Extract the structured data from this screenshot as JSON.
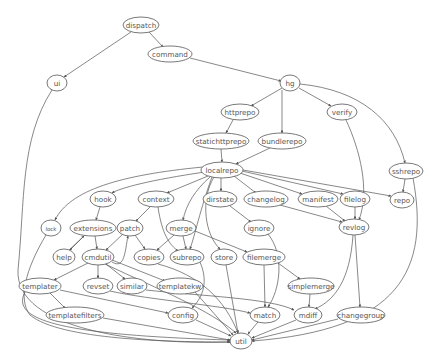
{
  "diagram": {
    "type": "directed-graph",
    "nodes": [
      {
        "id": "dispatch",
        "label": "dispatch",
        "x": 141,
        "y": 25,
        "rx": 18,
        "ry": 8
      },
      {
        "id": "command",
        "label": "command",
        "x": 170,
        "y": 54,
        "rx": 22,
        "ry": 8
      },
      {
        "id": "ui",
        "label": "ui",
        "x": 57,
        "y": 83,
        "rx": 10,
        "ry": 8
      },
      {
        "id": "hg",
        "label": "hg",
        "x": 290,
        "y": 83,
        "rx": 10,
        "ry": 8
      },
      {
        "id": "httprepo",
        "label": "httprepo",
        "x": 240,
        "y": 112,
        "rx": 19,
        "ry": 8
      },
      {
        "id": "verify",
        "label": "verify",
        "x": 342,
        "y": 112,
        "rx": 15,
        "ry": 8
      },
      {
        "id": "statichttprepo",
        "label": "statichttprepo",
        "x": 221,
        "y": 141,
        "rx": 28,
        "ry": 8
      },
      {
        "id": "bundlerepo",
        "label": "bundlerepo",
        "x": 282,
        "y": 141,
        "rx": 24,
        "ry": 8
      },
      {
        "id": "localrepo",
        "label": "localrepo",
        "x": 222,
        "y": 170,
        "rx": 21,
        "ry": 8
      },
      {
        "id": "sshrepo",
        "label": "sshrepo",
        "x": 406,
        "y": 171,
        "rx": 17,
        "ry": 8
      },
      {
        "id": "hook",
        "label": "hook",
        "x": 103,
        "y": 199,
        "rx": 13,
        "ry": 8
      },
      {
        "id": "context",
        "label": "context",
        "x": 156,
        "y": 199,
        "rx": 18,
        "ry": 8
      },
      {
        "id": "dirstate",
        "label": "dirstate",
        "x": 220,
        "y": 199,
        "rx": 17,
        "ry": 8
      },
      {
        "id": "changelog",
        "label": "changelog",
        "x": 266,
        "y": 199,
        "rx": 22,
        "ry": 8
      },
      {
        "id": "manifest",
        "label": "manifest",
        "x": 318,
        "y": 199,
        "rx": 20,
        "ry": 8
      },
      {
        "id": "filelog",
        "label": "filelog",
        "x": 355,
        "y": 199,
        "rx": 15,
        "ry": 8
      },
      {
        "id": "repo",
        "label": "repo",
        "x": 402,
        "y": 200,
        "rx": 12,
        "ry": 8
      },
      {
        "id": "lock",
        "label": "lock",
        "x": 51,
        "y": 228,
        "rx": 10,
        "ry": 8,
        "small": true
      },
      {
        "id": "extensions",
        "label": "extensions",
        "x": 93,
        "y": 228,
        "rx": 23,
        "ry": 8
      },
      {
        "id": "patch",
        "label": "patch",
        "x": 130,
        "y": 228,
        "rx": 13,
        "ry": 8
      },
      {
        "id": "merge",
        "label": "merge",
        "x": 181,
        "y": 228,
        "rx": 15,
        "ry": 8
      },
      {
        "id": "ignore",
        "label": "ignore",
        "x": 259,
        "y": 228,
        "rx": 15,
        "ry": 8
      },
      {
        "id": "revlog",
        "label": "revlog",
        "x": 354,
        "y": 227,
        "rx": 15,
        "ry": 8
      },
      {
        "id": "help",
        "label": "help",
        "x": 64,
        "y": 257,
        "rx": 11,
        "ry": 8
      },
      {
        "id": "cmdutil",
        "label": "cmdutil",
        "x": 98,
        "y": 257,
        "rx": 16,
        "ry": 8
      },
      {
        "id": "copies",
        "label": "copies",
        "x": 149,
        "y": 257,
        "rx": 15,
        "ry": 8
      },
      {
        "id": "subrepo",
        "label": "subrepo",
        "x": 187,
        "y": 257,
        "rx": 17,
        "ry": 8
      },
      {
        "id": "store",
        "label": "store",
        "x": 224,
        "y": 257,
        "rx": 13,
        "ry": 8
      },
      {
        "id": "filemerge",
        "label": "filemerge",
        "x": 264,
        "y": 257,
        "rx": 21,
        "ry": 8
      },
      {
        "id": "templater",
        "label": "templater",
        "x": 40,
        "y": 286,
        "rx": 21,
        "ry": 8
      },
      {
        "id": "revset",
        "label": "revset",
        "x": 98,
        "y": 286,
        "rx": 15,
        "ry": 8
      },
      {
        "id": "similar",
        "label": "similar",
        "x": 132,
        "y": 286,
        "rx": 15,
        "ry": 8
      },
      {
        "id": "templatekw",
        "label": "templatekw",
        "x": 180,
        "y": 286,
        "rx": 23,
        "ry": 8
      },
      {
        "id": "simplemerge",
        "label": "simplemerge",
        "x": 311,
        "y": 286,
        "rx": 23,
        "ry": 8
      },
      {
        "id": "templatefilters",
        "label": "templatefilters",
        "x": 75,
        "y": 315,
        "rx": 29,
        "ry": 8
      },
      {
        "id": "config",
        "label": "config",
        "x": 183,
        "y": 315,
        "rx": 15,
        "ry": 8
      },
      {
        "id": "match",
        "label": "match",
        "x": 265,
        "y": 315,
        "rx": 15,
        "ry": 8
      },
      {
        "id": "mdiff",
        "label": "mdiff",
        "x": 308,
        "y": 315,
        "rx": 14,
        "ry": 8
      },
      {
        "id": "changegroup",
        "label": "changegroup",
        "x": 361,
        "y": 315,
        "rx": 24,
        "ry": 8
      },
      {
        "id": "util",
        "label": "util",
        "x": 241,
        "y": 341,
        "rx": 11,
        "ry": 8
      }
    ],
    "edges": [
      {
        "from": "dispatch",
        "to": "command",
        "d": "M149,32 L163,47"
      },
      {
        "from": "dispatch",
        "to": "ui",
        "d": "M131,32 L64,77"
      },
      {
        "from": "command",
        "to": "hg",
        "d": "M190,58 L281,81"
      },
      {
        "from": "hg",
        "to": "httprepo",
        "d": "M282,88 L251,106"
      },
      {
        "from": "hg",
        "to": "bundlerepo",
        "d": "M282,90 L282,133"
      },
      {
        "from": "hg",
        "to": "verify",
        "d": "M299,88 L331,106"
      },
      {
        "from": "hg",
        "to": "sshrepo",
        "d": "M300,84 C360,90 395,120 405,163"
      },
      {
        "from": "httprepo",
        "to": "statichttprepo",
        "d": "M233,120 L226,133"
      },
      {
        "from": "statichttprepo",
        "to": "localrepo",
        "d": "M221,149 L222,162"
      },
      {
        "from": "bundlerepo",
        "to": "localrepo",
        "d": "M270,148 L236,164"
      },
      {
        "from": "verify",
        "to": "revlog",
        "d": "M346,120 C360,150 370,190 359,220"
      },
      {
        "from": "sshrepo",
        "to": "repo",
        "d": "M405,179 L403,192"
      },
      {
        "from": "sshrepo",
        "to": "util",
        "d": "M413,178 C430,270 400,330 252,341"
      },
      {
        "from": "ui",
        "to": "util",
        "d": "M52,90 C20,140 25,200 18,270 C15,330 140,345 230,342"
      },
      {
        "from": "localrepo",
        "to": "lock",
        "d": "M203,167 C120,175 70,190 55,220"
      },
      {
        "from": "localrepo",
        "to": "hook",
        "d": "M205,172 C150,180 120,188 112,193"
      },
      {
        "from": "localrepo",
        "to": "context",
        "d": "M208,176 L167,193"
      },
      {
        "from": "localrepo",
        "to": "merge",
        "d": "M210,177 C195,190 186,205 183,220"
      },
      {
        "from": "localrepo",
        "to": "store",
        "d": "M214,177 C200,200 205,235 220,249"
      },
      {
        "from": "localrepo",
        "to": "dirstate",
        "d": "M221,178 L221,191"
      },
      {
        "from": "localrepo",
        "to": "changelog",
        "d": "M234,176 L256,193"
      },
      {
        "from": "localrepo",
        "to": "manifest",
        "d": "M240,173 L302,194"
      },
      {
        "from": "localrepo",
        "to": "filelog",
        "d": "M242,171 L343,194"
      },
      {
        "from": "localrepo",
        "to": "repo",
        "d": "M243,170 L391,196"
      },
      {
        "from": "localrepo",
        "to": "subrepo",
        "d": "M212,177 C200,210 195,235 190,249"
      },
      {
        "from": "dirstate",
        "to": "ignore",
        "d": "M230,206 L251,222"
      },
      {
        "from": "changelog",
        "to": "revlog",
        "d": "M280,205 L342,222"
      },
      {
        "from": "manifest",
        "to": "revlog",
        "d": "M326,206 L345,221"
      },
      {
        "from": "filelog",
        "to": "revlog",
        "d": "M355,207 L355,219"
      },
      {
        "from": "revlog",
        "to": "changegroup",
        "d": "M355,235 L360,307"
      },
      {
        "from": "revlog",
        "to": "mdiff",
        "d": "M353,235 C350,280 335,300 315,309"
      },
      {
        "from": "ignore",
        "to": "match",
        "d": "M268,234 C285,255 280,290 268,307"
      },
      {
        "from": "hook",
        "to": "extensions",
        "d": "M100,207 L96,220"
      },
      {
        "from": "extensions",
        "to": "help",
        "d": "M85,235 L70,250"
      },
      {
        "from": "help",
        "to": "extensions",
        "d": "M69,250 L84,236"
      },
      {
        "from": "extensions",
        "to": "cmdutil",
        "d": "M95,236 L97,249"
      },
      {
        "from": "context",
        "to": "patch",
        "d": "M150,207 L136,221"
      },
      {
        "from": "context",
        "to": "subrepo",
        "d": "M158,207 C162,235 170,245 178,251"
      },
      {
        "from": "patch",
        "to": "cmdutil",
        "d": "M123,234 L106,250"
      },
      {
        "from": "patch",
        "to": "copies",
        "d": "M135,235 L145,249"
      },
      {
        "from": "merge",
        "to": "copies",
        "d": "M174,235 L157,250"
      },
      {
        "from": "merge",
        "to": "subrepo",
        "d": "M183,236 L186,249"
      },
      {
        "from": "merge",
        "to": "filemerge",
        "d": "M195,231 L247,252"
      },
      {
        "from": "cmdutil",
        "to": "templater",
        "d": "M88,263 L54,280"
      },
      {
        "from": "cmdutil",
        "to": "revset",
        "d": "M98,265 L98,278"
      },
      {
        "from": "cmdutil",
        "to": "similar",
        "d": "M106,264 L125,279"
      },
      {
        "from": "cmdutil",
        "to": "templatekw",
        "d": "M112,260 L165,281"
      },
      {
        "from": "cmdutil",
        "to": "patch",
        "d": "M112,262 C125,270 125,250 128,236"
      },
      {
        "from": "copies",
        "to": "util",
        "d": "M158,264 C200,275 225,300 238,333"
      },
      {
        "from": "subrepo",
        "to": "config",
        "d": "M200,262 C210,285 200,300 192,308"
      },
      {
        "from": "store",
        "to": "util",
        "d": "M226,265 L238,333"
      },
      {
        "from": "filemerge",
        "to": "match",
        "d": "M264,265 L265,307"
      },
      {
        "from": "filemerge",
        "to": "simplemerge",
        "d": "M278,263 L300,279"
      },
      {
        "from": "simplemerge",
        "to": "mdiff",
        "d": "M310,294 L309,307"
      },
      {
        "from": "templater",
        "to": "templatefilters",
        "d": "M50,293 L65,308"
      },
      {
        "from": "templater",
        "to": "config",
        "d": "M60,290 L168,313"
      },
      {
        "from": "templater",
        "to": "util",
        "d": "M25,292 C10,320 60,335 230,340"
      },
      {
        "from": "revset",
        "to": "match",
        "d": "M110,291 C150,300 220,305 250,313"
      },
      {
        "from": "similar",
        "to": "mdiff",
        "d": "M146,290 C200,296 270,298 294,310"
      },
      {
        "from": "templatekw",
        "to": "util",
        "d": "M195,292 L233,335"
      },
      {
        "from": "templatefilters",
        "to": "util",
        "d": "M103,318 L230,340"
      },
      {
        "from": "config",
        "to": "util",
        "d": "M196,320 L231,336"
      },
      {
        "from": "match",
        "to": "util",
        "d": "M258,322 L248,334"
      },
      {
        "from": "mdiff",
        "to": "util",
        "d": "M296,320 L252,338"
      },
      {
        "from": "changegroup",
        "to": "util",
        "d": "M338,319 L252,340"
      },
      {
        "from": "lock",
        "to": "util",
        "d": "M46,235 C25,270 18,300 30,315 C60,340 170,342 230,342"
      },
      {
        "from": "cmdutil",
        "to": "util",
        "d": "M105,264 C160,290 210,310 236,333"
      }
    ]
  }
}
